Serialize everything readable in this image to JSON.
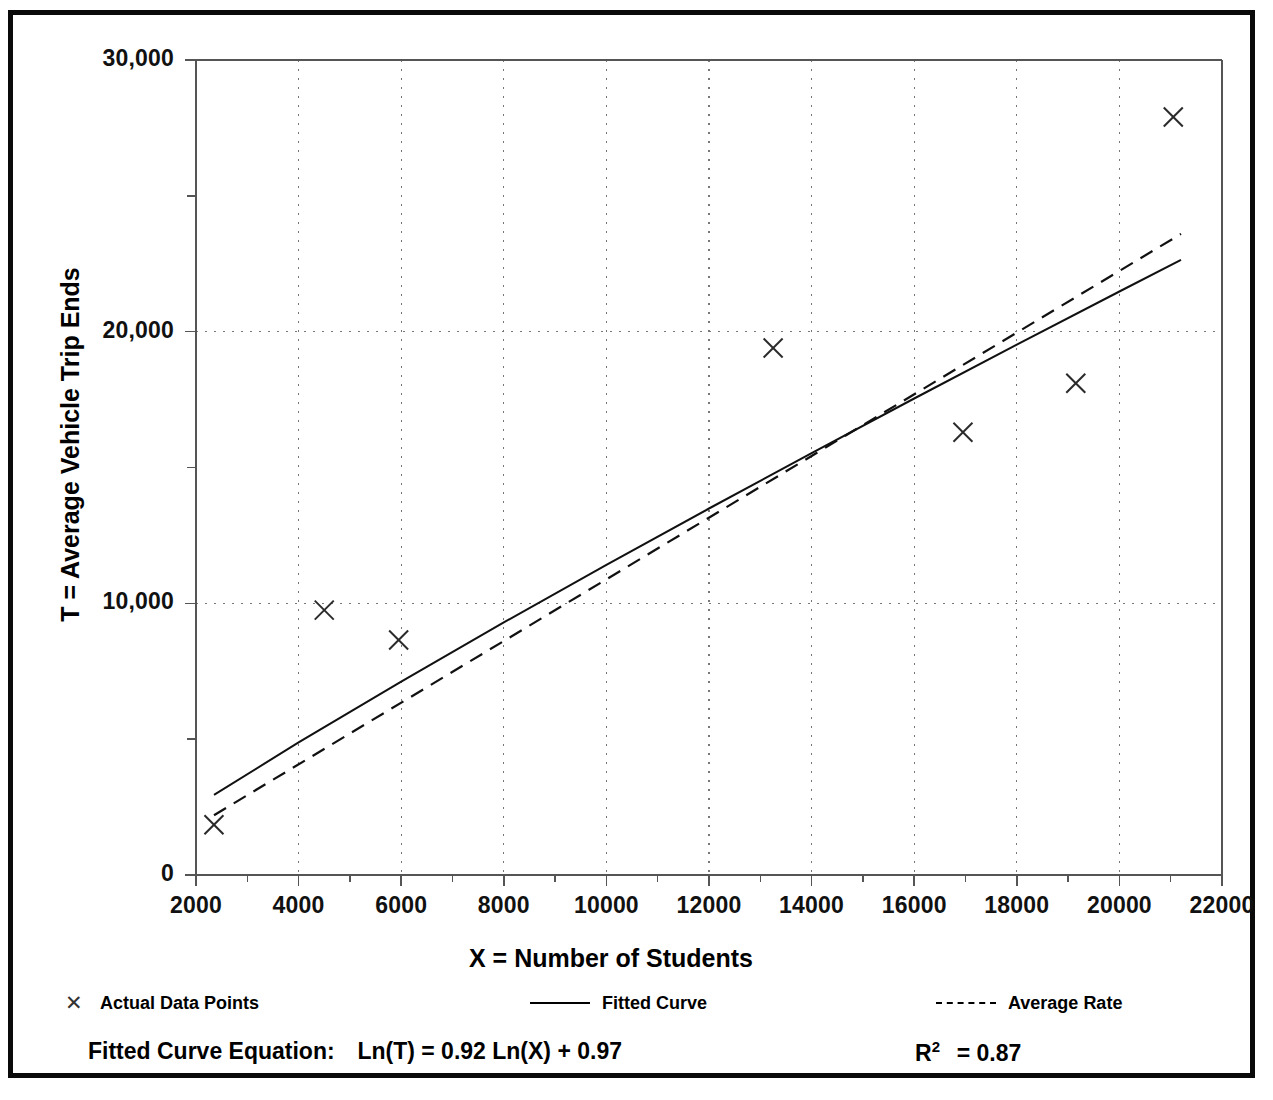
{
  "chart_data": {
    "type": "scatter",
    "title": "",
    "xlabel": "X = Number of Students",
    "ylabel": "T = Average Vehicle Trip Ends",
    "xlim": [
      2000,
      22000
    ],
    "ylim": [
      0,
      30000
    ],
    "xticks": [
      2000,
      4000,
      6000,
      8000,
      10000,
      12000,
      14000,
      16000,
      18000,
      20000,
      22000
    ],
    "xtick_labels": [
      "2000",
      "4000",
      "6000",
      "8000",
      "10000",
      "12000",
      "14000",
      "16000",
      "18000",
      "20000",
      "22000"
    ],
    "yticks": [
      0,
      10000,
      20000,
      30000
    ],
    "ytick_labels": [
      "0",
      "10,000",
      "20,000",
      "30,000"
    ],
    "yminor_ticks": [
      5000,
      15000,
      25000
    ],
    "grid": "dotted-both",
    "legend_position": "below-plot",
    "series": [
      {
        "name": "Actual Data Points",
        "type": "scatter",
        "marker": "x",
        "points": [
          {
            "x": 2350,
            "y": 1850
          },
          {
            "x": 4500,
            "y": 9750
          },
          {
            "x": 5950,
            "y": 8650
          },
          {
            "x": 13250,
            "y": 19400
          },
          {
            "x": 16950,
            "y": 16300
          },
          {
            "x": 19150,
            "y": 18100
          },
          {
            "x": 21050,
            "y": 27900
          }
        ]
      },
      {
        "name": "Fitted Curve",
        "type": "line",
        "style": "solid",
        "points": [
          {
            "x": 2350,
            "y": 2950
          },
          {
            "x": 4000,
            "y": 4880
          },
          {
            "x": 6000,
            "y": 7120
          },
          {
            "x": 8000,
            "y": 9300
          },
          {
            "x": 10000,
            "y": 11420
          },
          {
            "x": 12000,
            "y": 13490
          },
          {
            "x": 14000,
            "y": 15530
          },
          {
            "x": 16000,
            "y": 17540
          },
          {
            "x": 18000,
            "y": 19520
          },
          {
            "x": 20000,
            "y": 21480
          },
          {
            "x": 21200,
            "y": 22640
          }
        ]
      },
      {
        "name": "Average Rate",
        "type": "line",
        "style": "dashed",
        "points": [
          {
            "x": 2350,
            "y": 2200
          },
          {
            "x": 21200,
            "y": 23600
          }
        ]
      }
    ]
  },
  "legend": {
    "items": [
      {
        "label": "Actual Data Points",
        "symbol": "marker-x"
      },
      {
        "label": "Fitted Curve",
        "symbol": "solid-line"
      },
      {
        "label": "Average Rate",
        "symbol": "dashed-line"
      }
    ]
  },
  "footer": {
    "equation_label": "Fitted Curve Equation:",
    "equation": "Ln(T) = 0.92 Ln(X) + 0.97",
    "rsquared_label": "R",
    "rsquared_exponent": "2",
    "rsquared_value": "= 0.87"
  },
  "colors": {
    "border": "#0a0a0a",
    "axis": "#555555",
    "grid": "#777777",
    "series": "#111111",
    "background": "#ffffff"
  }
}
